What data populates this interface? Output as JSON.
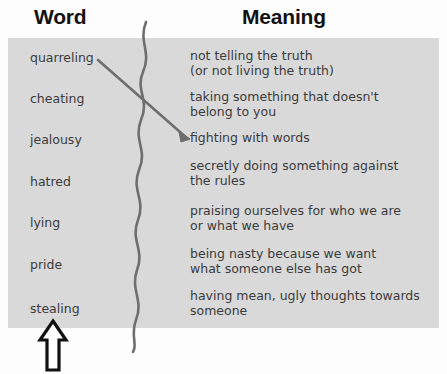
{
  "headings": {
    "word": "Word",
    "meaning": "Meaning"
  },
  "colors": {
    "panel_background": "#d9d9d9",
    "page_background": "#fdfdfd",
    "heading_text": "#121212",
    "body_text": "#3b3b3b",
    "line_stroke": "#6e6e6e",
    "pointer_outline": "#111111",
    "pointer_fill": "#ffffff"
  },
  "words": [
    {
      "label": "quarreling",
      "top": 12
    },
    {
      "label": "cheating",
      "top": 53
    },
    {
      "label": "jealousy",
      "top": 94
    },
    {
      "label": "hatred",
      "top": 136
    },
    {
      "label": "lying",
      "top": 177
    },
    {
      "label": "pride",
      "top": 219
    },
    {
      "label": "stealing",
      "top": 263
    }
  ],
  "meanings": [
    {
      "label": "not telling the truth\n(or not living the truth)",
      "top": 10
    },
    {
      "label": "taking something that doesn't\nbelong to you",
      "top": 51
    },
    {
      "label": "fighting with words",
      "top": 92
    },
    {
      "label": "secretly doing something against\nthe rules",
      "top": 120
    },
    {
      "label": "praising ourselves for who we are\nor what we have",
      "top": 165
    },
    {
      "label": "being nasty because we want\nwhat someone else has got",
      "top": 208
    },
    {
      "label": "having mean, ugly thoughts towards\nsomeone",
      "top": 250
    }
  ],
  "annotations": {
    "connector": {
      "name": "quarreling-to-fighting-connector",
      "from_word": "quarreling",
      "to_meaning": "fighting with words",
      "path": "M 98 60 L 188 139",
      "arrowhead": "M 190 139 L 179 132 L 181 142 Z"
    },
    "wavy_divider": {
      "name": "wavy-divider-line",
      "path": "M 146 22 C 138 42, 152 52, 143 72 C 135 90, 150 100, 141 120 C 133 140, 148 150, 139 170 C 131 190, 146 200, 138 220 C 130 240, 145 250, 137 270 C 130 290, 144 300, 136 320 C 130 336, 138 344, 133 352"
    },
    "pointer_arrow": {
      "name": "upward-pointer-arrow",
      "points_at": "stealing",
      "path": "M 17 3 L 30 22 L 23 22 L 23 52 L 11 52 L 11 22 L 4 22 Z"
    }
  }
}
